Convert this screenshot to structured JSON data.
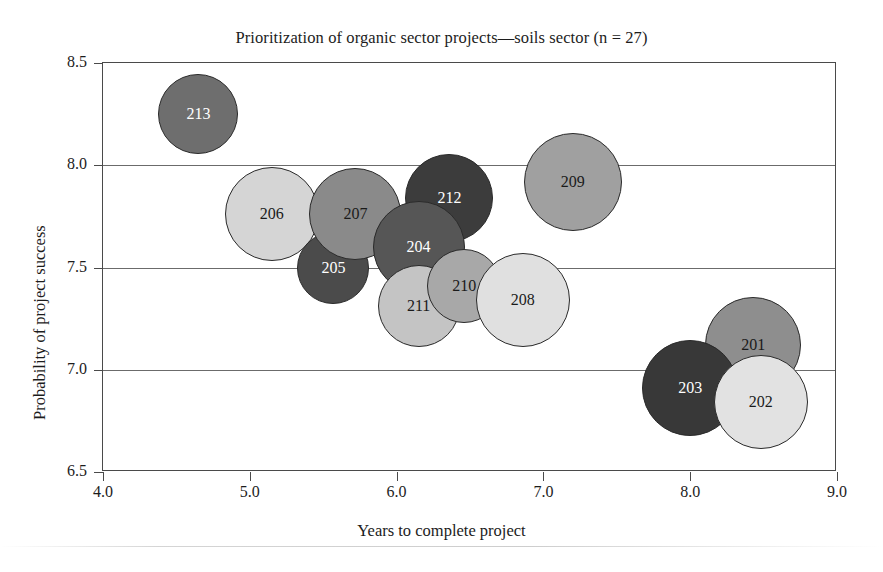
{
  "chart_data": {
    "type": "scatter",
    "title": "Prioritization of organic sector projects—soils sector (n = 27)",
    "xlabel": "Years to complete project",
    "ylabel": "Probability of project success",
    "xlim": [
      4.0,
      9.0
    ],
    "ylim": [
      6.5,
      8.5
    ],
    "xticks": [
      "4.0",
      "5.0",
      "6.0",
      "7.0",
      "8.0",
      "9.0"
    ],
    "yticks": [
      "6.5",
      "7.0",
      "7.5",
      "8.0",
      "8.5"
    ],
    "grid": "horizontal",
    "legend": "none",
    "bubbles": [
      {
        "label": "213",
        "x": 4.65,
        "y": 8.25,
        "size": 40,
        "fill": "#6e6e6e",
        "text_color": "#ffffff"
      },
      {
        "label": "206",
        "x": 5.15,
        "y": 7.76,
        "size": 47,
        "fill": "#d5d5d5",
        "text_color": "#1a1a1a"
      },
      {
        "label": "205",
        "x": 5.57,
        "y": 7.5,
        "size": 36,
        "fill": "#4b4b4b",
        "text_color": "#ffffff"
      },
      {
        "label": "207",
        "x": 5.72,
        "y": 7.76,
        "size": 46,
        "fill": "#8a8a8a",
        "text_color": "#1a1a1a"
      },
      {
        "label": "212",
        "x": 6.36,
        "y": 7.84,
        "size": 44,
        "fill": "#3c3c3c",
        "text_color": "#ffffff"
      },
      {
        "label": "204",
        "x": 6.15,
        "y": 7.6,
        "size": 46,
        "fill": "#565656",
        "text_color": "#ffffff"
      },
      {
        "label": "211",
        "x": 6.15,
        "y": 7.31,
        "size": 41,
        "fill": "#c4c4c4",
        "text_color": "#1a1a1a"
      },
      {
        "label": "210",
        "x": 6.46,
        "y": 7.41,
        "size": 37,
        "fill": "#a8a8a8",
        "text_color": "#1a1a1a"
      },
      {
        "label": "208",
        "x": 6.86,
        "y": 7.34,
        "size": 47,
        "fill": "#e0e0e0",
        "text_color": "#1a1a1a"
      },
      {
        "label": "209",
        "x": 7.2,
        "y": 7.92,
        "size": 49,
        "fill": "#a0a0a0",
        "text_color": "#1a1a1a"
      },
      {
        "label": "201",
        "x": 8.43,
        "y": 7.12,
        "size": 48,
        "fill": "#8e8e8e",
        "text_color": "#1a1a1a"
      },
      {
        "label": "203",
        "x": 8.0,
        "y": 6.91,
        "size": 48,
        "fill": "#383838",
        "text_color": "#ffffff"
      },
      {
        "label": "202",
        "x": 8.48,
        "y": 6.84,
        "size": 47,
        "fill": "#e2e2e2",
        "text_color": "#1a1a1a"
      }
    ]
  }
}
